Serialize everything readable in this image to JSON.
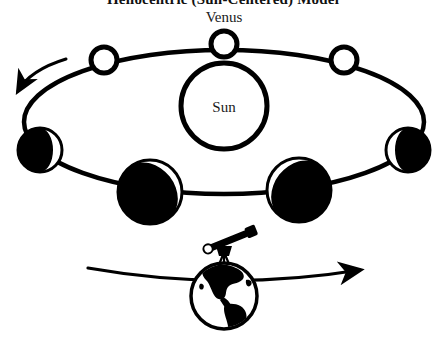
{
  "title": "Heliocentric (Sun-Centered) Model",
  "labels": {
    "venus": "Venus",
    "sun": "Sun"
  },
  "colors": {
    "ink": "#000000",
    "background": "#ffffff",
    "lit": "#ffffff",
    "shadow": "#000000"
  },
  "diagram": {
    "type": "astronomy-phase-diagram",
    "sun": {
      "cx": 224,
      "cy": 106,
      "r": 43,
      "stroke_width": 5,
      "fill": "none"
    },
    "orbit": {
      "name": "venus-orbit",
      "cx": 224,
      "cy": 122,
      "rx": 200,
      "ry": 72,
      "stroke_width": 4.5,
      "direction": "counterclockwise"
    },
    "direction_arrow": {
      "name": "orbit-direction-arrow",
      "points_to": "left",
      "label": "counterclockwise orbital motion"
    },
    "venus_positions": [
      {
        "id": "top-center",
        "cx": 224,
        "cy": 44,
        "r": 13,
        "phase": "full",
        "lit_fraction": 1.0,
        "terminator": "none",
        "label_above": "Venus"
      },
      {
        "id": "upper-left",
        "cx": 104,
        "cy": 60,
        "r": 13,
        "phase": "full",
        "lit_fraction": 1.0,
        "terminator": "none"
      },
      {
        "id": "upper-right",
        "cx": 344,
        "cy": 60,
        "r": 13,
        "phase": "full",
        "lit_fraction": 1.0,
        "terminator": "none"
      },
      {
        "id": "left",
        "cx": 40,
        "cy": 150,
        "r": 22,
        "phase": "crescent",
        "lit_fraction": 0.32,
        "terminator": "lit-right"
      },
      {
        "id": "right",
        "cx": 408,
        "cy": 150,
        "r": 22,
        "phase": "crescent",
        "lit_fraction": 0.32,
        "terminator": "lit-left"
      },
      {
        "id": "lower-left",
        "cx": 150,
        "cy": 192,
        "r": 32,
        "phase": "thin-crescent",
        "lit_fraction": 0.12,
        "terminator": "lit-upper-right"
      },
      {
        "id": "lower-right",
        "cx": 299,
        "cy": 190,
        "r": 32,
        "phase": "thin-crescent",
        "lit_fraction": 0.12,
        "terminator": "lit-upper-left"
      }
    ],
    "earth": {
      "name": "earth-globe",
      "cx": 224,
      "cy": 296,
      "r": 33,
      "stroke_width": 3.5,
      "continents": "Americas silhouette"
    },
    "telescope": {
      "name": "telescope",
      "x": 224,
      "y": 252,
      "tilt_degrees": -22,
      "mount": "tripod"
    },
    "earth_orbit_arrow": {
      "name": "earth-orbit-arrow",
      "points_to": "right",
      "y": 277,
      "x_start": 88,
      "x_end": 368
    }
  }
}
